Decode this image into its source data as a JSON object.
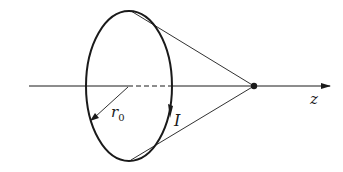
{
  "diagram": {
    "labels": {
      "radius": "r",
      "radius_subscript": "0",
      "current": "I",
      "axis": "z"
    },
    "colors": {
      "stroke": "#1a1a1a",
      "background": "#ffffff"
    }
  }
}
